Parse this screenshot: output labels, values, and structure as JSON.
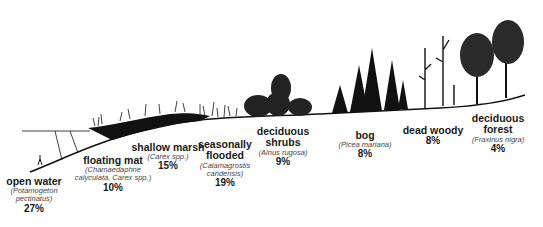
{
  "diagram": {
    "type": "wetland vegetation zonation transect",
    "zones": [
      {
        "name": "open water",
        "scientific": "(Potamogeton pectinatus)",
        "percent": "27%"
      },
      {
        "name": "floating mat",
        "scientific": "(Chamaedaphne calyculata, Carex spp.)",
        "percent": "10%"
      },
      {
        "name": "shallow marsh",
        "scientific": "(Carex spp.)",
        "percent": "15%"
      },
      {
        "name": "seasonally flooded",
        "scientific": "(Calamagrostis candensis)",
        "percent": "19%"
      },
      {
        "name": "deciduous shrubs",
        "scientific": "(Alnus rugosa)",
        "percent": "9%"
      },
      {
        "name": "bog",
        "scientific": "(Picea mariana)",
        "percent": "8%"
      },
      {
        "name": "dead woody",
        "scientific": "",
        "percent": "8%"
      },
      {
        "name": "deciduous forest",
        "scientific": "(Fraxinus nigra)",
        "percent": "4%"
      }
    ],
    "colors": {
      "ink": "#111111",
      "background": "#ffffff"
    }
  }
}
